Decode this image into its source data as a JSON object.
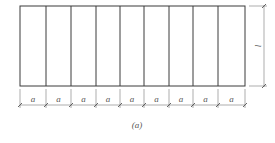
{
  "diagram": {
    "caption": "(a)",
    "panel_count": 9,
    "panel_label": "a",
    "height_label": "l",
    "dimension_labels": [
      "a",
      "a",
      "a",
      "a",
      "a",
      "a",
      "a",
      "a",
      "a"
    ],
    "colors": {
      "outline": "#3a3a3a",
      "dimension": "#8a8a8a",
      "text": "#555555"
    }
  }
}
